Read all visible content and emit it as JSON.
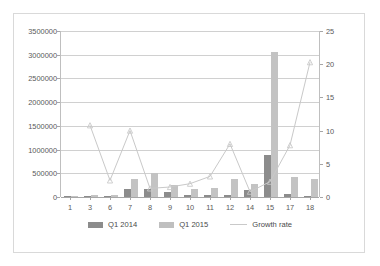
{
  "chart_data": {
    "type": "bar",
    "title": "",
    "subtitle": "",
    "xlabel": "",
    "ylabel": "",
    "categories": [
      "1",
      "3",
      "6",
      "7",
      "8",
      "9",
      "10",
      "11",
      "12",
      "14",
      "15",
      "17",
      "18"
    ],
    "series": [
      {
        "name": "Q1 2014",
        "axis": "left",
        "color": "#8c8c8c",
        "type": "bar",
        "values": [
          8000,
          20000,
          8000,
          175000,
          175000,
          100000,
          45000,
          35000,
          45000,
          150000,
          880000,
          55000,
          12000
        ]
      },
      {
        "name": "Q1 2015",
        "axis": "left",
        "color": "#c3c3c3",
        "type": "bar",
        "values": [
          10000,
          45000,
          45000,
          390000,
          500000,
          255000,
          165000,
          180000,
          390000,
          280000,
          3050000,
          420000,
          375000
        ]
      },
      {
        "name": "Growth rate",
        "axis": "right",
        "color": "#c9c9c9",
        "type": "line",
        "values": [
          null,
          10.8,
          2.5,
          10.0,
          1.3,
          1.5,
          2.0,
          3.1,
          8.0,
          0.8,
          2.3,
          7.8,
          20.3
        ]
      }
    ],
    "axes": {
      "left": {
        "min": 0,
        "max": 3500000,
        "step": 500000,
        "ticks": [
          "0",
          "500000",
          "1000000",
          "1500000",
          "2000000",
          "2500000",
          "3000000",
          "3500000"
        ]
      },
      "right": {
        "min": 0,
        "max": 25,
        "step": 5,
        "ticks": [
          "0",
          "5",
          "10",
          "15",
          "20",
          "25"
        ]
      }
    },
    "grid": true,
    "legend_position": "bottom",
    "legend": [
      "Q1 2014",
      "Q1 2015",
      "Growth rate"
    ]
  }
}
